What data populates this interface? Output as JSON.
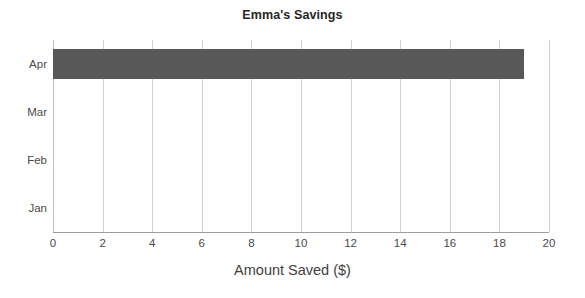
{
  "chart_data": {
    "type": "bar",
    "orientation": "horizontal",
    "title": "Emma's Savings",
    "xlabel": "Amount Saved ($)",
    "ylabel": "",
    "categories": [
      "Jan",
      "Feb",
      "Mar",
      "Apr"
    ],
    "values": [
      0,
      0,
      0,
      19
    ],
    "xlim": [
      0,
      20
    ],
    "xticks": [
      0,
      2,
      4,
      6,
      8,
      10,
      12,
      14,
      16,
      18,
      20
    ],
    "xtick_labels": [
      "0",
      "2",
      "4",
      "6",
      "8",
      "10",
      "12",
      "14",
      "16",
      "18",
      "20"
    ],
    "grid": "vertical",
    "legend": "none",
    "bar_color": "#585858",
    "gridline_color": "#d2d2d2",
    "axis_color": "#9e9e9e",
    "text_color": "#4a4a4a",
    "title_color": "#262626"
  }
}
